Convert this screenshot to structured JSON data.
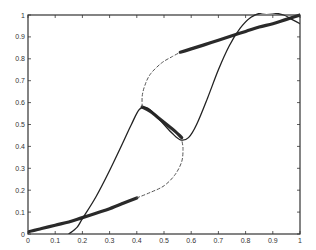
{
  "chart_data": {
    "type": "line",
    "title": "",
    "xlabel": "",
    "ylabel": "",
    "xlim": [
      0,
      1
    ],
    "ylim": [
      0,
      1
    ],
    "grid": false,
    "x_ticks": [
      "0",
      "0.1",
      "0.2",
      "0.3",
      "0.4",
      "0.5",
      "0.6",
      "0.7",
      "0.8",
      "0.9",
      "1"
    ],
    "y_ticks": [
      "0",
      "0.1",
      "0.2",
      "0.3",
      "0.4",
      "0.5",
      "0.6",
      "0.7",
      "0.8",
      "0.9",
      "1"
    ],
    "series": [
      {
        "name": "stable-lower-branch",
        "style": "thick",
        "points": [
          [
            0,
            0.01
          ],
          [
            0.05,
            0.025
          ],
          [
            0.1,
            0.04
          ],
          [
            0.15,
            0.055
          ],
          [
            0.2,
            0.075
          ],
          [
            0.25,
            0.095
          ],
          [
            0.3,
            0.115
          ],
          [
            0.35,
            0.14
          ],
          [
            0.4,
            0.165
          ]
        ]
      },
      {
        "name": "unstable-lower-connector",
        "style": "dashed",
        "points": [
          [
            0.4,
            0.165
          ],
          [
            0.45,
            0.19
          ],
          [
            0.5,
            0.22
          ],
          [
            0.54,
            0.27
          ],
          [
            0.565,
            0.33
          ],
          [
            0.57,
            0.39
          ],
          [
            0.565,
            0.43
          ]
        ]
      },
      {
        "name": "stable-middle-branch",
        "style": "thick",
        "points": [
          [
            0.42,
            0.58
          ],
          [
            0.45,
            0.56
          ],
          [
            0.48,
            0.53
          ],
          [
            0.51,
            0.5
          ],
          [
            0.54,
            0.47
          ],
          [
            0.565,
            0.44
          ]
        ]
      },
      {
        "name": "unstable-upper-connector",
        "style": "dashed",
        "points": [
          [
            0.42,
            0.58
          ],
          [
            0.42,
            0.63
          ],
          [
            0.43,
            0.68
          ],
          [
            0.45,
            0.73
          ],
          [
            0.49,
            0.78
          ],
          [
            0.53,
            0.81
          ],
          [
            0.56,
            0.83
          ]
        ]
      },
      {
        "name": "stable-upper-branch",
        "style": "thick",
        "points": [
          [
            0.56,
            0.83
          ],
          [
            0.6,
            0.845
          ],
          [
            0.65,
            0.865
          ],
          [
            0.7,
            0.885
          ],
          [
            0.75,
            0.905
          ],
          [
            0.8,
            0.925
          ],
          [
            0.85,
            0.945
          ],
          [
            0.9,
            0.96
          ],
          [
            0.95,
            0.98
          ],
          [
            1.0,
            1.0
          ]
        ]
      },
      {
        "name": "approximation-curve",
        "style": "thin",
        "points": [
          [
            0.15,
            0.0
          ],
          [
            0.18,
            0.03
          ],
          [
            0.2,
            0.07
          ],
          [
            0.25,
            0.17
          ],
          [
            0.3,
            0.29
          ],
          [
            0.35,
            0.42
          ],
          [
            0.38,
            0.5
          ],
          [
            0.41,
            0.57
          ],
          [
            0.44,
            0.575
          ],
          [
            0.47,
            0.54
          ],
          [
            0.5,
            0.5
          ],
          [
            0.53,
            0.46
          ],
          [
            0.56,
            0.43
          ],
          [
            0.59,
            0.44
          ],
          [
            0.62,
            0.5
          ],
          [
            0.66,
            0.62
          ],
          [
            0.7,
            0.75
          ],
          [
            0.74,
            0.86
          ],
          [
            0.78,
            0.94
          ],
          [
            0.82,
            0.99
          ],
          [
            0.86,
            1.01
          ],
          [
            0.9,
            1.01
          ],
          [
            0.94,
            1.0
          ],
          [
            0.97,
            0.98
          ],
          [
            1.0,
            0.96
          ]
        ]
      }
    ]
  }
}
